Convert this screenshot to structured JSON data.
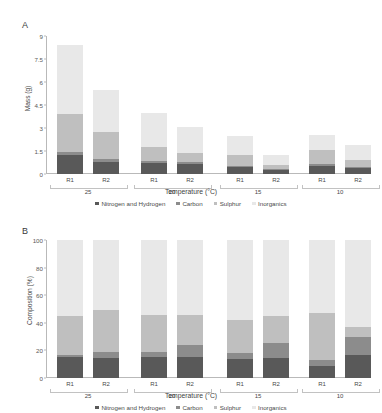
{
  "figure": {
    "panel_a_letter": "A",
    "panel_b_letter": "B"
  },
  "series_colors": {
    "nitrogen_and_hydrogen": "#595959",
    "carbon": "#8c8c8c",
    "sulphur": "#bfbfbf",
    "inorganics": "#e8e8e8"
  },
  "legend": {
    "items": [
      {
        "label": "Nitrogen and Hydrogen",
        "color": "#595959"
      },
      {
        "label": "Carbon",
        "color": "#8c8c8c"
      },
      {
        "label": "Sulphur",
        "color": "#bfbfbf"
      },
      {
        "label": "Inorganics",
        "color": "#e8e8e8"
      }
    ]
  },
  "chart_data": [
    {
      "panel": "A",
      "type": "bar",
      "stacked": true,
      "title": "",
      "xlabel": "Temperature (°C)",
      "ylabel": "Mass (g)",
      "ylim": [
        0,
        9
      ],
      "yticks": [
        0,
        1.5,
        3,
        4.5,
        6,
        7.5,
        9
      ],
      "ytick_labels": [
        "0",
        "1.5",
        "3",
        "4.5",
        "6",
        "7.5",
        "9"
      ],
      "grid": false,
      "legend_position": "bottom",
      "groups": [
        "25",
        "20",
        "15",
        "10"
      ],
      "replicates": [
        "R1",
        "R2"
      ],
      "categories": [
        "25 R1",
        "25 R2",
        "20 R1",
        "20 R2",
        "15 R1",
        "15 R2",
        "10 R1",
        "10 R2"
      ],
      "series": [
        {
          "name": "Nitrogen and Hydrogen",
          "values": [
            1.25,
            0.78,
            0.73,
            0.66,
            0.43,
            0.29,
            0.52,
            0.38
          ]
        },
        {
          "name": "Carbon",
          "values": [
            0.17,
            0.2,
            0.13,
            0.13,
            0.12,
            0.07,
            0.11,
            0.1
          ]
        },
        {
          "name": "Sulphur",
          "values": [
            2.48,
            1.73,
            0.88,
            0.6,
            0.66,
            0.25,
            0.94,
            0.42
          ]
        },
        {
          "name": "Inorganics",
          "values": [
            4.5,
            2.79,
            2.21,
            1.71,
            1.3,
            0.62,
            0.98,
            1.02
          ]
        }
      ],
      "totals": [
        8.4,
        5.5,
        3.95,
        3.1,
        2.51,
        1.23,
        2.55,
        1.92
      ]
    },
    {
      "panel": "B",
      "type": "bar",
      "stacked": true,
      "normalized": true,
      "title": "",
      "xlabel": "Temperature (°C)",
      "ylabel": "Composition (%)",
      "ylim": [
        0,
        100
      ],
      "yticks": [
        0,
        20,
        40,
        60,
        80,
        100
      ],
      "ytick_labels": [
        "0",
        "20",
        "40",
        "60",
        "80",
        "100"
      ],
      "grid": false,
      "legend_position": "bottom",
      "groups": [
        "25",
        "20",
        "15",
        "10"
      ],
      "replicates": [
        "R1",
        "R2"
      ],
      "categories": [
        "25 R1",
        "25 R2",
        "20 R1",
        "20 R2",
        "15 R1",
        "15 R2",
        "10 R1",
        "10 R2"
      ],
      "series": [
        {
          "name": "Nitrogen and Hydrogen",
          "values": [
            14.9,
            14.2,
            15.3,
            15.3,
            13.8,
            14.7,
            8.8,
            16.9
          ]
        },
        {
          "name": "Carbon",
          "values": [
            2.0,
            4.8,
            3.3,
            8.7,
            4.2,
            10.4,
            4.3,
            13.1
          ]
        },
        {
          "name": "Sulphur",
          "values": [
            28.3,
            30.1,
            27.1,
            21.4,
            23.8,
            20.1,
            33.7,
            6.8
          ]
        },
        {
          "name": "Inorganics",
          "values": [
            54.8,
            50.9,
            54.3,
            54.6,
            58.2,
            54.8,
            53.2,
            63.2
          ]
        }
      ],
      "totals": [
        100,
        100,
        100,
        100,
        100,
        100,
        100,
        100
      ]
    }
  ]
}
